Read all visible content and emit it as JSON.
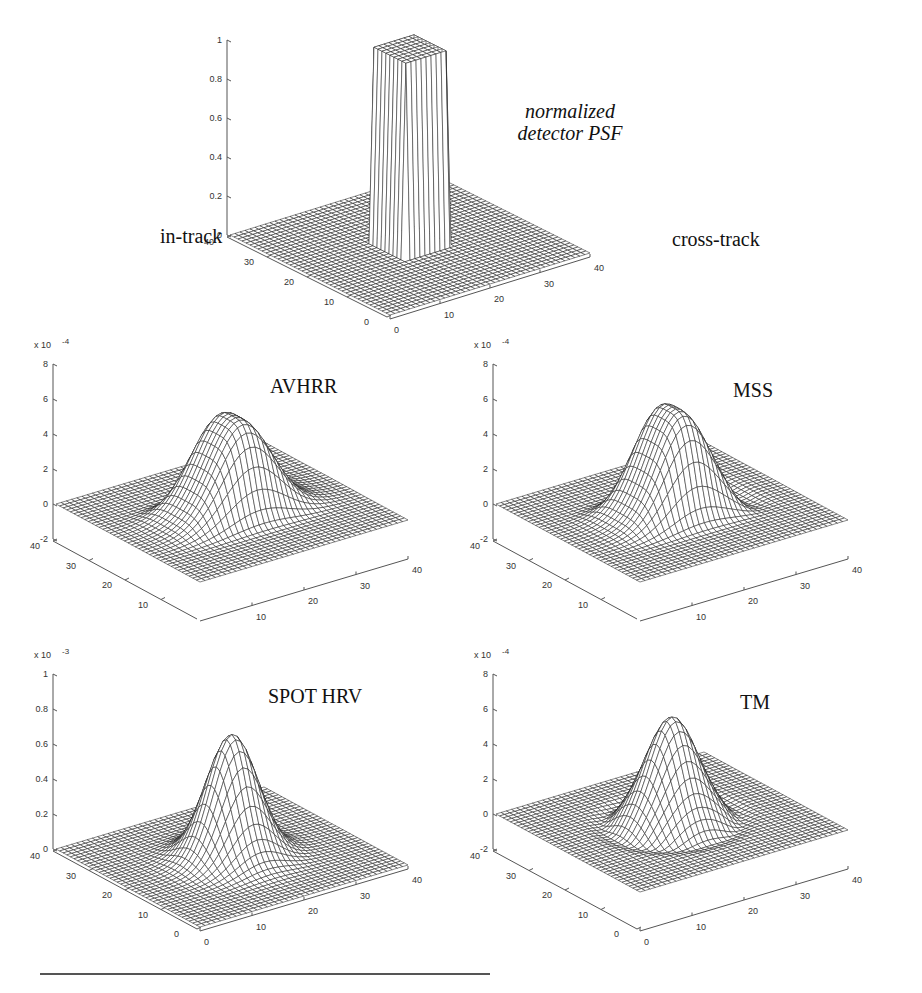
{
  "figure": {
    "axis_labels": {
      "in_track": "in-track",
      "cross_track": "cross-track"
    }
  },
  "chart_data": [
    {
      "id": "detector",
      "type": "surface",
      "surface_kind": "box",
      "title_lines": [
        "normalized",
        "detector PSF"
      ],
      "title_style": "italic",
      "xlabel": "cross-track",
      "ylabel": "in-track",
      "zlabel": "",
      "x_ticks": [
        "0",
        "10",
        "20",
        "30",
        "40"
      ],
      "y_ticks": [
        "0",
        "10",
        "20",
        "30",
        "40"
      ],
      "z_ticks": [
        "0",
        "0.2",
        "0.4",
        "0.6",
        "0.8",
        "1"
      ],
      "z_multiplier": "",
      "xlim": [
        0,
        40
      ],
      "ylim": [
        0,
        40
      ],
      "zlim": [
        0,
        1
      ],
      "peak": 1.0,
      "grid": true
    },
    {
      "id": "avhrr",
      "type": "surface",
      "surface_kind": "broad-flat-top",
      "title_lines": [
        "AVHRR"
      ],
      "xlabel": "",
      "ylabel": "",
      "zlabel": "",
      "x_ticks": [
        "10",
        "20",
        "30",
        "40"
      ],
      "y_ticks": [
        "10",
        "20",
        "30",
        "40"
      ],
      "z_ticks": [
        "-2",
        "0",
        "2",
        "4",
        "6",
        "8"
      ],
      "z_multiplier": "x 10",
      "z_exponent": "-4",
      "xlim": [
        0,
        40
      ],
      "ylim": [
        0,
        40
      ],
      "zlim": [
        -2,
        8
      ],
      "peak": 5.5,
      "grid": true
    },
    {
      "id": "mss",
      "type": "surface",
      "surface_kind": "broad-with-undershoot",
      "title_lines": [
        "MSS"
      ],
      "xlabel": "",
      "ylabel": "",
      "zlabel": "",
      "x_ticks": [
        "10",
        "20",
        "30",
        "40"
      ],
      "y_ticks": [
        "10",
        "20",
        "30",
        "40"
      ],
      "z_ticks": [
        "-2",
        "0",
        "2",
        "4",
        "6",
        "8"
      ],
      "z_multiplier": "x 10",
      "z_exponent": "-4",
      "xlim": [
        0,
        40
      ],
      "ylim": [
        0,
        40
      ],
      "zlim": [
        -2,
        8
      ],
      "peak": 6.0,
      "grid": true
    },
    {
      "id": "spot_hrv",
      "type": "surface",
      "surface_kind": "gaussian",
      "title_lines": [
        "SPOT HRV"
      ],
      "xlabel": "",
      "ylabel": "",
      "zlabel": "",
      "x_ticks": [
        "0",
        "10",
        "20",
        "30",
        "40"
      ],
      "y_ticks": [
        "0",
        "10",
        "20",
        "30",
        "40"
      ],
      "z_ticks": [
        "0",
        "0.2",
        "0.4",
        "0.6",
        "0.8",
        "1"
      ],
      "z_multiplier": "x 10",
      "z_exponent": "-3",
      "xlim": [
        0,
        40
      ],
      "ylim": [
        0,
        40
      ],
      "zlim": [
        0,
        1
      ],
      "peak": 0.7,
      "grid": true
    },
    {
      "id": "tm",
      "type": "surface",
      "surface_kind": "gaussian-with-undershoot",
      "title_lines": [
        "TM"
      ],
      "xlabel": "",
      "ylabel": "",
      "zlabel": "",
      "x_ticks": [
        "0",
        "10",
        "20",
        "30",
        "40"
      ],
      "y_ticks": [
        "0",
        "10",
        "20",
        "30",
        "40"
      ],
      "z_ticks": [
        "-2",
        "0",
        "2",
        "4",
        "6",
        "8"
      ],
      "z_multiplier": "x 10",
      "z_exponent": "-4",
      "xlim": [
        0,
        40
      ],
      "ylim": [
        0,
        40
      ],
      "zlim": [
        -2,
        8
      ],
      "peak": 6.0,
      "grid": true
    }
  ]
}
